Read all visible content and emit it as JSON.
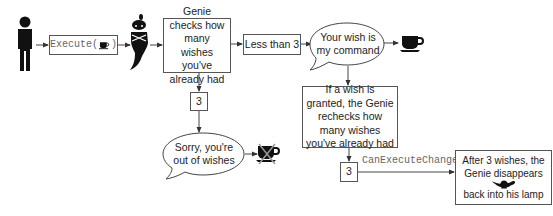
{
  "diagram": {
    "nodes": {
      "execute": {
        "prefix": "Execute(",
        "suffix": ")",
        "icon": "coffee-cup-icon"
      },
      "genie_checks": {
        "text": "Genie checks how many wishes you've already had"
      },
      "less_than_3": {
        "text": "Less than 3"
      },
      "your_wish": {
        "text": "Your wish is my command"
      },
      "three_left": {
        "text": "3"
      },
      "sorry": {
        "text": "Sorry, you're out of wishes"
      },
      "recheck": {
        "text": "If a wish is granted, the Genie rechecks how many wishes you've already had"
      },
      "three_right": {
        "text": "3"
      },
      "after3_top": {
        "text": "After 3 wishes, the Genie disappears"
      },
      "after3_bottom": {
        "text": "back into his lamp"
      }
    },
    "edge_labels": {
      "can_execute_changed": "CanExecuteChanged"
    },
    "icons": [
      "person-icon",
      "coffee-cup-icon",
      "genie-icon",
      "crossed-coffee-cup-icon",
      "magic-lamp-icon"
    ],
    "colors": {
      "stroke": "#555555",
      "icon_fill": "#111111",
      "mono_text": "#666666",
      "cross": "#999999"
    }
  }
}
